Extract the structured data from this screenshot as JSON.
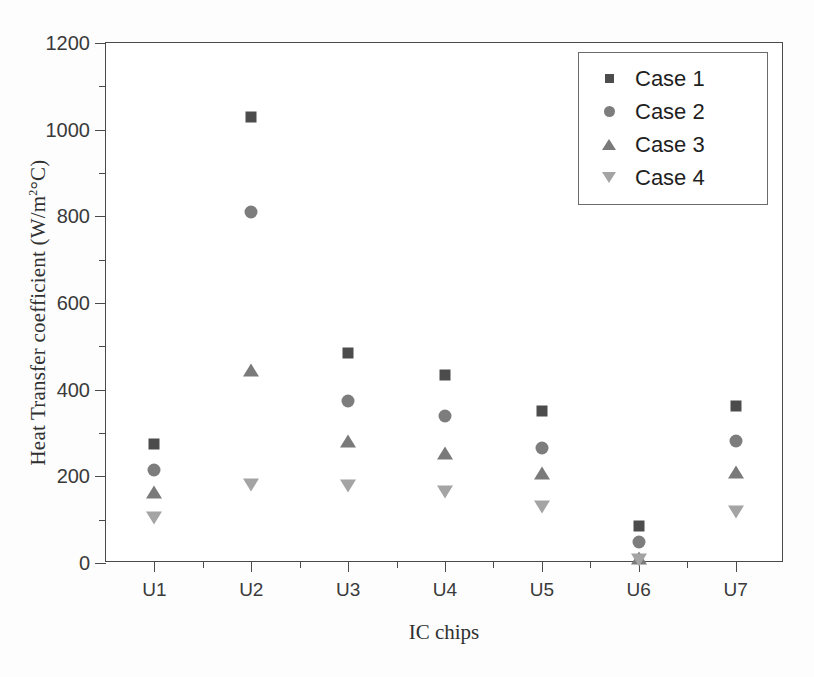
{
  "chart_data": {
    "type": "scatter",
    "title": "",
    "xlabel": "IC chips",
    "ylabel": "Heat Transfer coefficient (W/m2°C)",
    "ylabel_parts": {
      "main": "Heat Transfer coefficient (W/m",
      "sup": "2",
      "tail": "°C)"
    },
    "categories": [
      "U1",
      "U2",
      "U3",
      "U4",
      "U5",
      "U6",
      "U7"
    ],
    "ylim": [
      0,
      1200
    ],
    "ytick_values": [
      0,
      200,
      400,
      600,
      800,
      1000,
      1200
    ],
    "ytick_labels": [
      "0",
      "200",
      "400",
      "600",
      "800",
      "1000",
      "1200"
    ],
    "yminor_values": [
      100,
      300,
      500,
      700,
      900,
      1100
    ],
    "grid": false,
    "legend_position": "top-right",
    "series": [
      {
        "name": "Case 1",
        "marker": "square",
        "color": "#4c4c4c",
        "values": [
          275,
          1030,
          485,
          435,
          350,
          85,
          363
        ]
      },
      {
        "name": "Case 2",
        "marker": "circle",
        "color": "#7d7d7d",
        "values": [
          215,
          810,
          375,
          340,
          265,
          48,
          282
        ]
      },
      {
        "name": "Case 3",
        "marker": "triangle-up",
        "color": "#7a7a7a",
        "values": [
          165,
          445,
          282,
          255,
          208,
          12,
          210
        ]
      },
      {
        "name": "Case 4",
        "marker": "triangle-down",
        "color": "#a4a4a4",
        "values": [
          105,
          180,
          178,
          165,
          130,
          8,
          118
        ]
      }
    ]
  },
  "legend": {
    "items": [
      {
        "label": "Case 1",
        "marker": "square-marker-icon"
      },
      {
        "label": "Case 2",
        "marker": "circle-marker-icon"
      },
      {
        "label": "Case 3",
        "marker": "triangle-up-marker-icon"
      },
      {
        "label": "Case 4",
        "marker": "triangle-down-marker-icon"
      }
    ]
  }
}
